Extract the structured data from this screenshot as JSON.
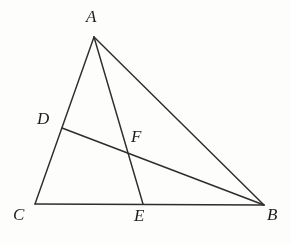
{
  "figure": {
    "background_color": "#fdfdfc",
    "stroke_color": "#2e2d2b",
    "label_color": "#1e1d1c",
    "points": {
      "A": {
        "label": "A",
        "x": 94,
        "y": 37,
        "label_x": 86,
        "label_y": 8
      },
      "B": {
        "label": "B",
        "x": 264,
        "y": 205,
        "label_x": 267,
        "label_y": 206
      },
      "C": {
        "label": "C",
        "x": 35,
        "y": 204,
        "label_x": 13,
        "label_y": 206
      },
      "D": {
        "label": "D",
        "x": 62,
        "y": 128,
        "label_x": 37,
        "label_y": 110
      },
      "E": {
        "label": "E",
        "x": 143,
        "y": 204,
        "label_x": 134,
        "label_y": 207
      },
      "F": {
        "label": "F",
        "x": 127,
        "y": 152,
        "label_x": 131,
        "label_y": 128
      }
    },
    "segments": [
      {
        "name": "side-CA",
        "from": "C",
        "to": "A"
      },
      {
        "name": "side-AB",
        "from": "A",
        "to": "B"
      },
      {
        "name": "side-CB",
        "from": "C",
        "to": "B"
      },
      {
        "name": "cevian-AE",
        "from": "A",
        "to": "E"
      },
      {
        "name": "cevian-DB",
        "from": "D",
        "to": "B"
      }
    ],
    "labels": [
      "A",
      "D",
      "F",
      "C",
      "E",
      "B"
    ]
  }
}
